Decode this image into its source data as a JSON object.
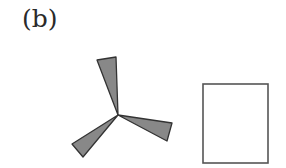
{
  "panel_label": "(b)",
  "figures": {
    "pinwheel": {
      "center": [
        118,
        115
      ],
      "blades": [
        {
          "points": "118,115 97,60 116,57"
        },
        {
          "points": "118,115 172,123 167,141"
        },
        {
          "points": "118,115 72,144 83,157"
        }
      ],
      "fill": "#888888",
      "stroke": "#333333"
    },
    "rectangle": {
      "x": 203,
      "y": 84,
      "width": 65,
      "height": 79,
      "fill": "#ffffff",
      "stroke": "#555555"
    }
  }
}
